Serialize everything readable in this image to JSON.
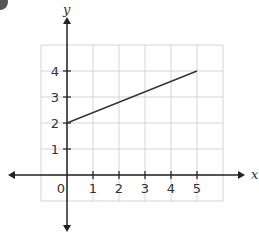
{
  "chart_data": {
    "type": "line",
    "title": "",
    "xlabel": "x",
    "ylabel": "y",
    "xlim": [
      -1,
      6
    ],
    "ylim": [
      -1,
      5
    ],
    "grid": true,
    "x_ticks": [
      "0",
      "1",
      "2",
      "3",
      "4",
      "5"
    ],
    "y_ticks": [
      "1",
      "2",
      "3",
      "4"
    ],
    "series": [
      {
        "name": "line",
        "x": [
          0,
          5
        ],
        "y": [
          2,
          4
        ]
      }
    ]
  },
  "colors": {
    "grid": "#d4d4d4",
    "axis": "#222222",
    "line": "#333333",
    "badge": "#555555"
  }
}
